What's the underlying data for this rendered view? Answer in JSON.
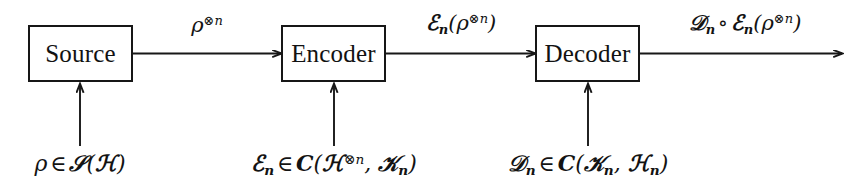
{
  "diagram": {
    "background_color": "#ffffff",
    "line_color": "#171717",
    "nodes": [
      {
        "id": "source",
        "label": "Source"
      },
      {
        "id": "encoder",
        "label": "Encoder"
      },
      {
        "id": "decoder",
        "label": "Decoder"
      }
    ],
    "flow_labels": [
      {
        "id": "rho-n",
        "text": "ρ⊗n",
        "plain": "rho^{\\otimes n}"
      },
      {
        "id": "encoded-state",
        "text": "ℰn(ρ⊗n)",
        "plain": "E_n(rho^{\\otimes n})"
      },
      {
        "id": "decoded-state",
        "text": "𝒟n ∘ ℰn(ρ⊗n)",
        "plain": "D_n o E_n(rho^{\\otimes n})"
      }
    ],
    "constraints": [
      {
        "id": "source-constraint",
        "text": "ρ ∈ 𝒮(ℋ)",
        "plain": "rho in S(H)"
      },
      {
        "id": "encoder-constraint",
        "text": "ℰn ∈ C(ℋ⊗n, 𝒦n)",
        "plain": "E_n in C(H^{otimes n}, K_n)"
      },
      {
        "id": "decoder-constraint",
        "text": "𝒟n ∈ C(𝒦n, ℋn)",
        "plain": "D_n in C(K_n, H_n)"
      }
    ]
  }
}
